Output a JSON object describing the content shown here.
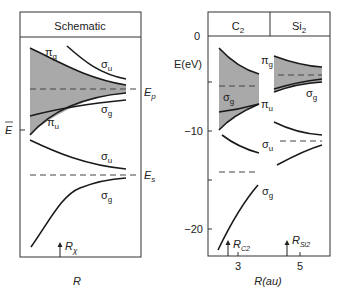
{
  "left_panel": {
    "header": "Schematic",
    "x_label": "R",
    "levels": {
      "Ep": "E",
      "Ep_sub": "p",
      "Es": "E",
      "Es_sub": "s",
      "Ebar": "E"
    },
    "orbitals": {
      "pi_g": "π",
      "pi_g_sub": "g",
      "sigma_u_top": "σ",
      "sigma_u_top_sub": "u",
      "sigma_g_mid": "σ",
      "sigma_g_mid_sub": "g",
      "pi_u": "π",
      "pi_u_sub": "u",
      "sigma_u_low": "σ",
      "sigma_u_low_sub": "u",
      "sigma_g_low": "σ",
      "sigma_g_low_sub": "g"
    },
    "marker": {
      "label": "R",
      "sub": "χ"
    }
  },
  "right_panel": {
    "headers": [
      {
        "main": "C",
        "sub": "2"
      },
      {
        "main": "Si",
        "sub": "2"
      }
    ],
    "y_label": "E(eV)",
    "y_ticks": [
      "0",
      "−10",
      "−20"
    ],
    "x_ticks": [
      "3",
      "5"
    ],
    "x_label": "R(au)",
    "orbitals": {
      "c2_sigma_g": "σ",
      "c2_sigma_g_sub": "g",
      "pi_u": "π",
      "pi_u_sub": "u",
      "si2_pi_g": "π",
      "si2_pi_g_sub": "g",
      "si2_sigma_g": "σ",
      "si2_sigma_g_sub": "g",
      "sigma_u": "σ",
      "sigma_u_sub": "u",
      "sigma_g_low": "σ",
      "sigma_g_low_sub": "g"
    },
    "markers": [
      {
        "label": "R",
        "sub": "C2"
      },
      {
        "label": "R",
        "sub": "Si2"
      }
    ]
  },
  "colors": {
    "band_fill": "#a9a9a9",
    "line": "#1a1a1a",
    "dash": "#444444"
  }
}
